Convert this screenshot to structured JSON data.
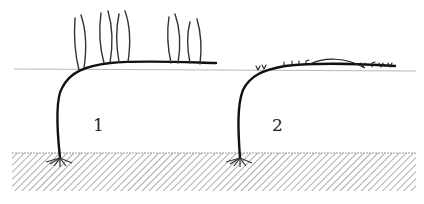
{
  "diagram": {
    "type": "botanical-illustration",
    "colors": {
      "stem": "#111111",
      "shoot": "#333333",
      "bud": "#222222",
      "horizon_line": "#b8b8b8",
      "soil_hatch": "#8a8a8a",
      "background": "#ffffff"
    },
    "figures": [
      {
        "id": "1",
        "label": "1",
        "shoot_type": "tall upright shoots",
        "shoot_count": 10
      },
      {
        "id": "2",
        "label": "2",
        "shoot_type": "short buds",
        "bud_count": 12
      }
    ],
    "ground": {
      "pattern": "diagonal-hatch"
    }
  }
}
